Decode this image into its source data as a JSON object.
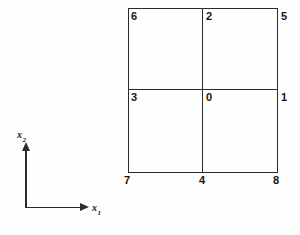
{
  "figure": {
    "type": "node-numbering-diagram",
    "stroke_color": "#2b2b2b",
    "text_color": "#141414",
    "background_color": "#fefefe"
  },
  "axes": {
    "x_axis": {
      "label": "x",
      "subscript": "1"
    },
    "y_axis": {
      "label": "x",
      "subscript": "2"
    }
  },
  "grid": {
    "square": {
      "left": 128,
      "top": 8,
      "right": 278,
      "bottom": 172
    },
    "mid_x": 202,
    "mid_y": 89,
    "rows": 2,
    "cols": 2
  },
  "nodes": [
    {
      "id": "node-0",
      "label": "0",
      "x": 206,
      "y": 92,
      "position": "center"
    },
    {
      "id": "node-1",
      "label": "1",
      "x": 281,
      "y": 92,
      "position": "mid-right"
    },
    {
      "id": "node-2",
      "label": "2",
      "x": 206,
      "y": 11,
      "position": "top-center"
    },
    {
      "id": "node-3",
      "label": "3",
      "x": 131,
      "y": 92,
      "position": "mid-left"
    },
    {
      "id": "node-4",
      "label": "4",
      "x": 199,
      "y": 175,
      "position": "bottom-center"
    },
    {
      "id": "node-5",
      "label": "5",
      "x": 281,
      "y": 11,
      "position": "top-right"
    },
    {
      "id": "node-6",
      "label": "6",
      "x": 131,
      "y": 11,
      "position": "top-left"
    },
    {
      "id": "node-7",
      "label": "7",
      "x": 124,
      "y": 175,
      "position": "bottom-left"
    },
    {
      "id": "node-8",
      "label": "8",
      "x": 273,
      "y": 175,
      "position": "bottom-right"
    }
  ]
}
